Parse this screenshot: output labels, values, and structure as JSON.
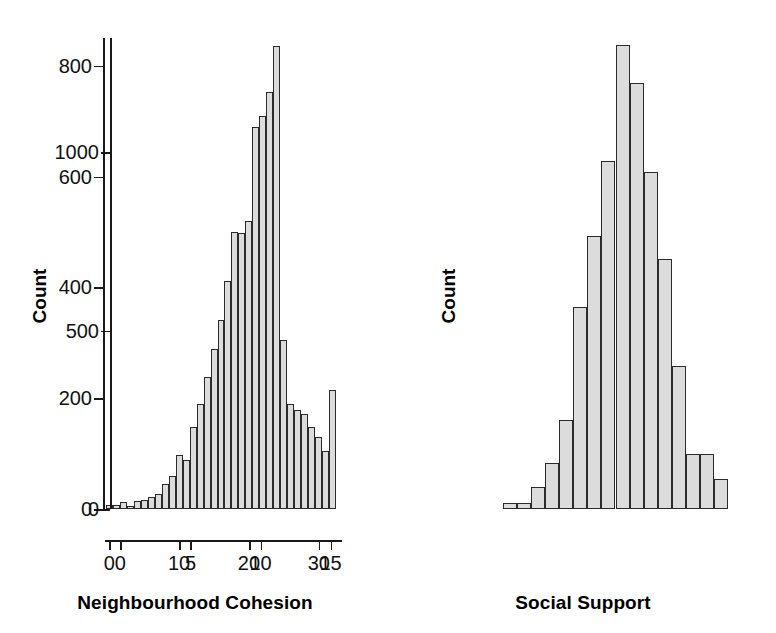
{
  "chart_data": [
    {
      "type": "bar",
      "title": "",
      "xlabel": "Neighbourhood Cohesion",
      "ylabel": "Count",
      "xlim": [
        -0.6,
        32.6
      ],
      "ylim": [
        0,
        850
      ],
      "xticks": [
        0,
        10,
        20,
        30
      ],
      "xtick_labels": [
        "0",
        "10",
        "20",
        "30"
      ],
      "yticks": [
        0,
        200,
        400,
        600,
        800
      ],
      "ytick_labels": [
        "0",
        "200",
        "400",
        "600",
        "800"
      ],
      "grid": false,
      "legend": false,
      "bar_color": "#dcdcdc",
      "edge_color": "#2b2b2b",
      "categories": [
        0,
        1,
        2,
        3,
        4,
        5,
        6,
        7,
        8,
        9,
        10,
        11,
        12,
        13,
        14,
        15,
        16,
        17,
        18,
        19,
        20,
        21,
        22,
        23,
        24,
        25,
        26,
        27,
        28,
        29,
        30,
        31,
        32
      ],
      "values": [
        7,
        7,
        12,
        6,
        14,
        17,
        22,
        28,
        45,
        60,
        97,
        88,
        148,
        190,
        238,
        288,
        342,
        412,
        500,
        498,
        520,
        690,
        710,
        752,
        835,
        305,
        190,
        178,
        172,
        148,
        130,
        105,
        215
      ]
    },
    {
      "type": "bar",
      "title": "",
      "xlabel": "Social Support",
      "ylabel": "Count",
      "xlim": [
        -0.6,
        15.6
      ],
      "ylim": [
        0,
        1320
      ],
      "xticks": [
        0,
        5,
        10,
        15
      ],
      "xtick_labels": [
        "0",
        "5",
        "10",
        "15"
      ],
      "yticks": [
        0,
        500,
        1000
      ],
      "ytick_labels": [
        "0",
        "500",
        "1000"
      ],
      "grid": false,
      "legend": false,
      "bar_color": "#dcdcdc",
      "edge_color": "#2b2b2b",
      "categories": [
        0,
        1,
        2,
        3,
        4,
        5,
        6,
        7,
        8,
        9,
        10,
        11,
        12,
        13,
        14,
        15
      ],
      "values": [
        18,
        18,
        62,
        130,
        250,
        565,
        765,
        975,
        1300,
        1195,
        945,
        700,
        400,
        155,
        155,
        85
      ]
    }
  ],
  "panels": [
    {
      "id": "left",
      "x_axis_title": "Neighbourhood Cohesion",
      "y_axis_title": "Count"
    },
    {
      "id": "right",
      "x_axis_title": "Social Support",
      "y_axis_title": "Count"
    }
  ]
}
